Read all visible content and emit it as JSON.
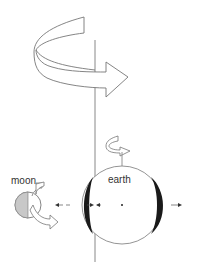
{
  "diagram": {
    "labels": {
      "moon": "moon",
      "earth": "earth"
    },
    "elements": {
      "rotation_axis": "vertical-line",
      "large_arrow": "orbital-rotation-arrow",
      "small_arrow": "earth-spin-arrow",
      "moon_arrow": "moon-orbit-arrow",
      "earth_bulges": [
        "left-tidal-bulge",
        "right-tidal-bulge"
      ],
      "force_arrows": [
        "left-force-arrow",
        "center-left-force-arrow",
        "right-force-arrow"
      ]
    },
    "colors": {
      "line": "#777777",
      "bulge": "#1a1a1a",
      "moon_shade": "#c8c8c8",
      "text": "#333333"
    }
  }
}
